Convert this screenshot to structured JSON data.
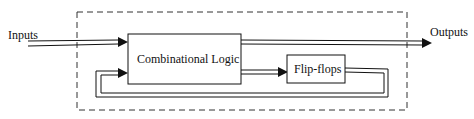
{
  "diagram": {
    "labels": {
      "inputs": "Inputs",
      "outputs": "Outputs",
      "combinational": "Combinational Logic",
      "flipflops": "Flip-flops"
    },
    "colors": {
      "stroke": "#111111",
      "dashed_border": "#333333",
      "background": "#ffffff"
    }
  }
}
